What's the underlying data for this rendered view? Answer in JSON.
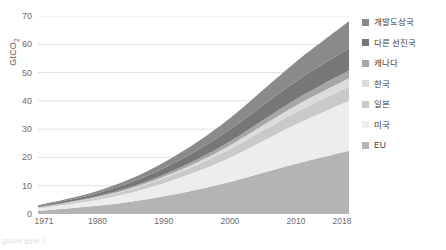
{
  "chart_data": {
    "type": "area",
    "stacked": true,
    "title": "",
    "xlabel": "",
    "ylabel": "GtCO2",
    "ylabel_display": "GtCO",
    "ylabel_sub": "2",
    "xlim": [
      1971,
      2018
    ],
    "ylim": [
      0,
      70
    ],
    "grid": true,
    "legend_position": "right",
    "x_tick_labels": [
      "1971",
      "1980",
      "1990",
      "2000",
      "2010",
      "2018"
    ],
    "x_tick_values": [
      1971,
      1980,
      1990,
      2000,
      2010,
      2018
    ],
    "y_tick_labels": [
      "0",
      "10",
      "20",
      "30",
      "40",
      "50",
      "60",
      "70"
    ],
    "y_tick_values": [
      0,
      10,
      20,
      30,
      40,
      50,
      60,
      70
    ],
    "x": [
      1971,
      1975,
      1980,
      1985,
      1990,
      1995,
      2000,
      2005,
      2010,
      2014,
      2018
    ],
    "series": [
      {
        "name": "EU",
        "color": "#b4b4b4",
        "values": [
          1.2,
          1.9,
          2.9,
          4.3,
          6.3,
          8.6,
          11.3,
          14.6,
          17.8,
          20.1,
          22.4
        ]
      },
      {
        "name": "미국",
        "color": "#ededed",
        "values": [
          0.8,
          1.3,
          2.1,
          3.2,
          4.6,
          6.4,
          8.6,
          11.2,
          13.9,
          15.8,
          17.6
        ]
      },
      {
        "name": "일본",
        "color": "#c9c9c9",
        "values": [
          0.3,
          0.5,
          0.8,
          1.2,
          1.7,
          2.3,
          3.0,
          3.7,
          4.3,
          4.7,
          5.0
        ]
      },
      {
        "name": "한국",
        "color": "#dcdcdc",
        "values": [
          0.05,
          0.1,
          0.18,
          0.32,
          0.55,
          0.9,
          1.35,
          1.85,
          2.35,
          2.7,
          3.0
        ]
      },
      {
        "name": "캐나다",
        "color": "#a6a6a6",
        "values": [
          0.12,
          0.2,
          0.32,
          0.5,
          0.75,
          1.05,
          1.4,
          1.8,
          2.2,
          2.45,
          2.7
        ]
      },
      {
        "name": "다른 선진국",
        "color": "#777777",
        "values": [
          0.4,
          0.65,
          1.05,
          1.6,
          2.3,
          3.2,
          4.2,
          5.3,
          6.4,
          7.1,
          7.8
        ]
      },
      {
        "name": "개발도상국",
        "color": "#8a8a8a",
        "values": [
          0.25,
          0.45,
          0.8,
          1.3,
          2.0,
          2.9,
          4.0,
          5.4,
          6.9,
          8.2,
          9.6
        ]
      }
    ],
    "totals_2018": 68.1,
    "stack_order_bottom_to_top": [
      "EU",
      "미국",
      "일본",
      "한국",
      "캐나다",
      "다른 선진국",
      "개발도상국"
    ]
  },
  "legend": {
    "items": [
      {
        "label": "개발도상국",
        "color": "#8a8a8a"
      },
      {
        "label": "다른 선진국",
        "color": "#777777"
      },
      {
        "label": "캐나다",
        "color": "#a6a6a6"
      },
      {
        "label": "한국",
        "color": "#dcdcdc"
      },
      {
        "label": "일본",
        "color": "#c9c9c9"
      },
      {
        "label": "미국",
        "color": "#ededed"
      },
      {
        "label": "EU",
        "color": "#b4b4b4"
      }
    ]
  },
  "footer": {
    "note": "출처자료의 설명 텍스트"
  },
  "style": {
    "gridline_color": "#d9d9d9",
    "axis_text_color": "#6b6b6b",
    "background": "#ffffff"
  }
}
